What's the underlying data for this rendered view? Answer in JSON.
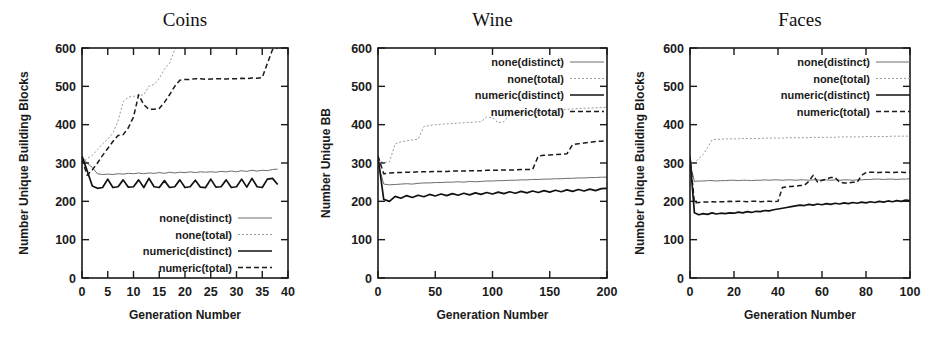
{
  "figure": {
    "panels": [
      "coins",
      "wine",
      "faces"
    ]
  },
  "legend": {
    "entries": [
      {
        "label": "none(distinct)",
        "style": "thin-solid-gray"
      },
      {
        "label": "none(total)",
        "style": "thin-dotted-gray"
      },
      {
        "label": "numeric(distinct)",
        "style": "thick-solid-black"
      },
      {
        "label": "numeric(total)",
        "style": "dashed-black"
      }
    ]
  },
  "chart_data": [
    {
      "type": "line",
      "title": "Coins",
      "xlabel": "Generation Number",
      "ylabel": "Number Unique Building Blocks",
      "xlim": [
        0,
        40
      ],
      "ylim": [
        0,
        600
      ],
      "xticks": [
        0,
        5,
        10,
        15,
        20,
        25,
        30,
        35,
        40
      ],
      "yticks": [
        0,
        100,
        200,
        300,
        400,
        500,
        600
      ],
      "grid": false,
      "legend_position": "lower-center",
      "x": [
        0,
        1,
        2,
        3,
        4,
        5,
        6,
        7,
        8,
        9,
        10,
        11,
        12,
        13,
        14,
        15,
        16,
        17,
        18,
        19,
        20,
        21,
        22,
        23,
        24,
        25,
        26,
        27,
        28,
        29,
        30,
        31,
        32,
        33,
        34,
        35,
        36,
        37,
        38
      ],
      "series": [
        {
          "name": "none(distinct)",
          "values": [
            315,
            300,
            288,
            272,
            270,
            271,
            270,
            272,
            271,
            273,
            272,
            274,
            272,
            274,
            273,
            275,
            273,
            276,
            274,
            276,
            275,
            277,
            275,
            277,
            276,
            277,
            276,
            278,
            277,
            279,
            277,
            280,
            278,
            281,
            279,
            281,
            280,
            283,
            284
          ]
        },
        {
          "name": "none(total)",
          "values": [
            300,
            312,
            320,
            335,
            350,
            362,
            378,
            410,
            460,
            472,
            474,
            476,
            478,
            500,
            505,
            520,
            545,
            560,
            596,
            610,
            620,
            630,
            640,
            650,
            660,
            665,
            670,
            675,
            680,
            685,
            690,
            695,
            700,
            705,
            710,
            715,
            720,
            725,
            730
          ]
        },
        {
          "name": "numeric(distinct)",
          "values": [
            318,
            280,
            240,
            234,
            236,
            258,
            236,
            238,
            256,
            237,
            238,
            256,
            236,
            260,
            238,
            236,
            254,
            236,
            238,
            256,
            236,
            238,
            255,
            237,
            236,
            258,
            237,
            238,
            256,
            236,
            238,
            258,
            237,
            260,
            238,
            236,
            258,
            260,
            244
          ]
        },
        {
          "name": "numeric(total)",
          "values": [
            310,
            268,
            282,
            300,
            320,
            338,
            356,
            372,
            374,
            392,
            420,
            478,
            452,
            440,
            440,
            442,
            458,
            478,
            500,
            516,
            518,
            518,
            520,
            520,
            518,
            519,
            520,
            520,
            519,
            520,
            520,
            521,
            520,
            522,
            521,
            523,
            560,
            596,
            600
          ]
        }
      ]
    },
    {
      "type": "line",
      "title": "Wine",
      "xlabel": "Generation Number",
      "ylabel": "Number Unique BB",
      "xlim": [
        0,
        200
      ],
      "ylim": [
        0,
        600
      ],
      "xticks": [
        0,
        50,
        100,
        150,
        200
      ],
      "yticks": [
        0,
        100,
        200,
        300,
        400,
        500,
        600
      ],
      "grid": false,
      "legend_position": "upper-center",
      "x": [
        0,
        5,
        10,
        15,
        20,
        25,
        30,
        35,
        40,
        45,
        50,
        55,
        60,
        65,
        70,
        75,
        80,
        85,
        90,
        95,
        100,
        105,
        110,
        115,
        120,
        125,
        130,
        135,
        140,
        145,
        150,
        155,
        160,
        165,
        170,
        175,
        180,
        185,
        190,
        195,
        200
      ],
      "series": [
        {
          "name": "none(distinct)",
          "values": [
            300,
            245,
            243,
            244,
            245,
            246,
            245,
            247,
            248,
            248,
            249,
            249,
            250,
            250,
            251,
            250,
            252,
            251,
            252,
            253,
            253,
            254,
            254,
            255,
            255,
            256,
            256,
            257,
            257,
            258,
            258,
            259,
            259,
            260,
            260,
            261,
            261,
            262,
            262,
            263,
            263
          ]
        },
        {
          "name": "none(total)",
          "values": [
            310,
            300,
            303,
            350,
            355,
            358,
            360,
            362,
            395,
            398,
            400,
            401,
            402,
            403,
            404,
            405,
            406,
            407,
            408,
            420,
            418,
            405,
            408,
            425,
            428,
            430,
            431,
            432,
            433,
            434,
            436,
            438,
            439,
            440,
            441,
            442,
            443,
            443,
            444,
            445,
            445
          ]
        },
        {
          "name": "numeric(distinct)",
          "values": [
            315,
            205,
            200,
            213,
            208,
            215,
            210,
            216,
            212,
            218,
            214,
            219,
            215,
            220,
            216,
            221,
            217,
            222,
            218,
            223,
            219,
            224,
            220,
            225,
            221,
            226,
            222,
            227,
            223,
            228,
            224,
            229,
            225,
            230,
            226,
            231,
            227,
            232,
            228,
            233,
            234
          ]
        },
        {
          "name": "numeric(total)",
          "values": [
            318,
            272,
            274,
            275,
            275,
            276,
            276,
            277,
            277,
            277,
            278,
            278,
            278,
            279,
            279,
            279,
            280,
            280,
            280,
            281,
            281,
            281,
            282,
            282,
            282,
            283,
            283,
            283,
            318,
            320,
            321,
            322,
            323,
            324,
            348,
            350,
            352,
            354,
            356,
            357,
            358
          ]
        }
      ]
    },
    {
      "type": "line",
      "title": "Faces",
      "xlabel": "Generation Number",
      "ylabel": "Number Unique Building Blocks",
      "xlim": [
        0,
        100
      ],
      "ylim": [
        0,
        600
      ],
      "xticks": [
        0,
        20,
        40,
        60,
        80,
        100
      ],
      "yticks": [
        0,
        100,
        200,
        300,
        400,
        500,
        600
      ],
      "grid": false,
      "legend_position": "upper-center",
      "x": [
        0,
        2,
        4,
        6,
        8,
        10,
        12,
        14,
        16,
        18,
        20,
        22,
        24,
        26,
        28,
        30,
        32,
        34,
        36,
        38,
        40,
        42,
        44,
        46,
        48,
        50,
        52,
        54,
        56,
        58,
        60,
        62,
        64,
        66,
        68,
        70,
        72,
        74,
        76,
        78,
        80,
        82,
        84,
        86,
        88,
        90,
        92,
        94,
        96,
        98,
        100
      ],
      "series": [
        {
          "name": "none(distinct)",
          "values": [
            300,
            252,
            253,
            253,
            254,
            254,
            253,
            254,
            254,
            255,
            255,
            254,
            255,
            255,
            254,
            255,
            255,
            256,
            255,
            256,
            256,
            255,
            256,
            256,
            255,
            256,
            256,
            255,
            256,
            256,
            255,
            256,
            255,
            256,
            255,
            256,
            256,
            255,
            256,
            256,
            257,
            257,
            258,
            258,
            257,
            258,
            258,
            257,
            258,
            258,
            259
          ]
        },
        {
          "name": "none(total)",
          "values": [
            305,
            300,
            312,
            322,
            340,
            360,
            362,
            362,
            363,
            363,
            363,
            363,
            364,
            364,
            364,
            364,
            364,
            365,
            365,
            365,
            365,
            365,
            366,
            366,
            366,
            366,
            366,
            366,
            367,
            367,
            367,
            367,
            367,
            367,
            368,
            368,
            368,
            368,
            368,
            368,
            369,
            369,
            369,
            369,
            369,
            369,
            370,
            370,
            370,
            370,
            370
          ]
        },
        {
          "name": "numeric(distinct)",
          "values": [
            315,
            170,
            165,
            168,
            166,
            170,
            167,
            169,
            168,
            170,
            169,
            172,
            170,
            173,
            171,
            174,
            173,
            176,
            175,
            178,
            180,
            182,
            184,
            186,
            188,
            190,
            189,
            192,
            190,
            193,
            191,
            194,
            192,
            195,
            193,
            196,
            194,
            197,
            195,
            198,
            196,
            199,
            197,
            200,
            198,
            201,
            199,
            202,
            200,
            203,
            202
          ]
        },
        {
          "name": "numeric(total)",
          "values": [
            318,
            196,
            197,
            198,
            198,
            199,
            198,
            199,
            199,
            200,
            199,
            200,
            200,
            199,
            200,
            200,
            199,
            200,
            200,
            199,
            200,
            236,
            238,
            239,
            240,
            241,
            242,
            252,
            268,
            250,
            255,
            258,
            262,
            262,
            250,
            248,
            248,
            250,
            250,
            268,
            275,
            276,
            276,
            275,
            276,
            276,
            275,
            276,
            276,
            275,
            276
          ]
        }
      ]
    }
  ]
}
